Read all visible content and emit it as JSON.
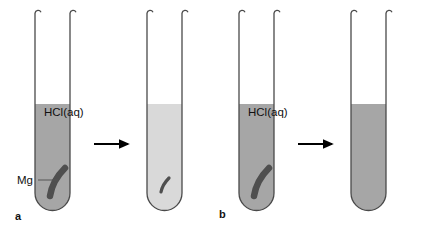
{
  "figure": {
    "width": 424,
    "height": 234,
    "background": "#ffffff"
  },
  "colors": {
    "tube_outline": "#4a4a4a",
    "liquid_dark": "#a6a6a6",
    "liquid_light": "#d9d9d9",
    "magnesium": "#4f4f4f",
    "arrow": "#000000",
    "text": "#111111",
    "leader_line": "#555555"
  },
  "labels": {
    "panel_a": "a",
    "panel_b": "b",
    "acid_a": "HCl(aq)",
    "acid_b": "HCl(aq)",
    "magnesium": "Mg"
  },
  "panels": [
    {
      "id": "a",
      "label": "a",
      "description": "Dilute hydrochloric acid: magnesium ribbon partly reacts, solution becomes lighter",
      "tubes": [
        {
          "role": "before",
          "acid_label": "HCl(aq)",
          "liquid_shade": "dark",
          "liquid_level_fraction": 0.55,
          "magnesium_present": true,
          "magnesium_size": "large"
        },
        {
          "role": "after",
          "acid_label": "",
          "liquid_shade": "light",
          "liquid_level_fraction": 0.55,
          "magnesium_present": true,
          "magnesium_size": "small"
        }
      ],
      "arrow": "right-arrow"
    },
    {
      "id": "b",
      "label": "b",
      "description": "Concentrated hydrochloric acid: magnesium ribbon fully consumed, solution stays dark",
      "tubes": [
        {
          "role": "before",
          "acid_label": "HCl(aq)",
          "liquid_shade": "dark",
          "liquid_level_fraction": 0.55,
          "magnesium_present": true,
          "magnesium_size": "large"
        },
        {
          "role": "after",
          "acid_label": "",
          "liquid_shade": "dark",
          "liquid_level_fraction": 0.55,
          "magnesium_present": false,
          "magnesium_size": "none"
        }
      ],
      "arrow": "right-arrow"
    }
  ]
}
